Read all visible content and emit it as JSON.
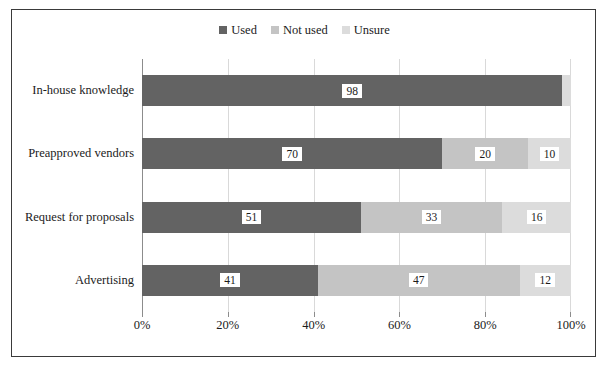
{
  "chart_data": {
    "type": "bar",
    "subtype": "stacked-horizontal-100",
    "title": "",
    "xlabel": "",
    "ylabel": "",
    "categories": [
      "In-house knowledge",
      "Preapproved vendors",
      "Request for proposals",
      "Advertising"
    ],
    "series": [
      {
        "name": "Used",
        "color": "#636363",
        "values": [
          98,
          70,
          51,
          41
        ]
      },
      {
        "name": "Not used",
        "color": "#c4c4c4",
        "values": [
          0,
          20,
          33,
          47
        ]
      },
      {
        "name": "Unsure",
        "color": "#dcdcdc",
        "values": [
          2,
          10,
          16,
          12
        ]
      }
    ],
    "data_labels": [
      [
        "98",
        "",
        ""
      ],
      [
        "70",
        "20",
        "10"
      ],
      [
        "51",
        "33",
        "16"
      ],
      [
        "41",
        "47",
        "12"
      ]
    ],
    "xlim": [
      0,
      100
    ],
    "x_ticks": [
      0,
      20,
      40,
      60,
      80,
      100
    ],
    "x_tick_labels": [
      "0%",
      "20%",
      "40%",
      "60%",
      "80%",
      "100%"
    ],
    "grid": "vertical",
    "legend_position": "top-center"
  },
  "legend": {
    "entries": [
      {
        "label": "Used"
      },
      {
        "label": "Not used"
      },
      {
        "label": "Unsure"
      }
    ]
  },
  "axis": {
    "x_tick_labels": [
      "0%",
      "20%",
      "40%",
      "60%",
      "80%",
      "100%"
    ],
    "category_labels": [
      "In-house knowledge",
      "Preapproved vendors",
      "Request for proposals",
      "Advertising"
    ]
  },
  "colors": {
    "used": "#636363",
    "not_used": "#c4c4c4",
    "unsure": "#dcdcdc",
    "gridline": "#d9d9d9",
    "axis": "#8c8c8c",
    "border": "#3a3a3a",
    "text": "#1b1b1b",
    "background": "#ffffff"
  }
}
